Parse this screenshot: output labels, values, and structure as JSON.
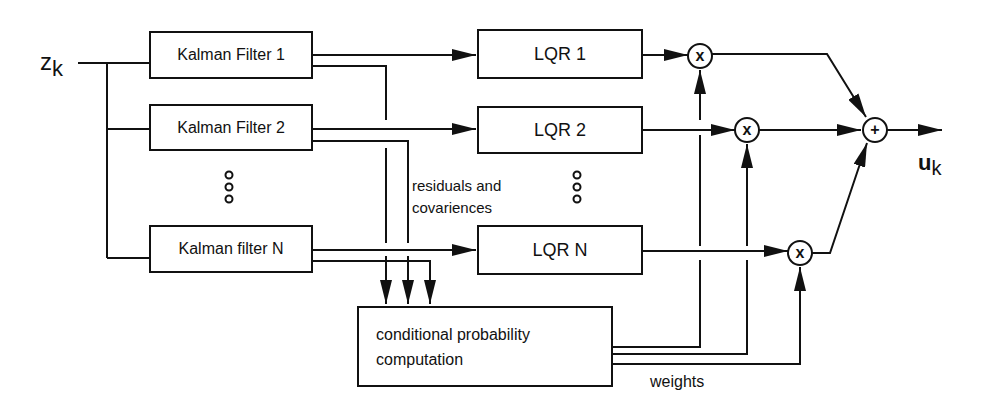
{
  "input_label": {
    "main": "z",
    "sub": "k"
  },
  "output_label": {
    "main": "u",
    "sub": "k"
  },
  "kalman_filters": [
    {
      "label": "Kalman Filter 1"
    },
    {
      "label": "Kalman Filter 2"
    },
    {
      "label": "Kalman filter N"
    }
  ],
  "lqr_blocks": [
    {
      "label": "LQR 1"
    },
    {
      "label": "LQR 2"
    },
    {
      "label": "LQR N"
    }
  ],
  "multipliers": [
    "x",
    "x",
    "x"
  ],
  "summer": "+",
  "ellipsis": "ooo",
  "residuals_label": {
    "line1": "residuals and",
    "line2": "covariences"
  },
  "cpc_block": {
    "line1": "conditional probability",
    "line2": "computation"
  },
  "weights_label": "weights"
}
